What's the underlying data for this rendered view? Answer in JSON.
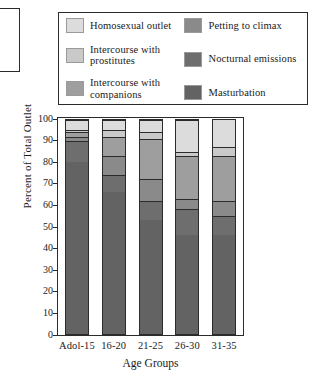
{
  "chart_data": {
    "type": "bar",
    "subtype": "stacked-percentage",
    "title": "",
    "xlabel": "Age Groups",
    "ylabel": "Percent of Total Outlet",
    "ylim": [
      0,
      100
    ],
    "yticks": [
      0,
      10,
      20,
      30,
      40,
      50,
      60,
      70,
      80,
      90,
      100
    ],
    "grid": false,
    "legend_position": "above-plot",
    "categories": [
      "Adol-15",
      "16-20",
      "21-25",
      "26-30",
      "31-35"
    ],
    "series": [
      {
        "name": "Masturbation",
        "color": "#636363",
        "values": [
          80,
          66,
          53,
          46,
          46
        ]
      },
      {
        "name": "Nocturnal emissions",
        "color": "#6e6e6e",
        "values": [
          10,
          8,
          9,
          12,
          9
        ]
      },
      {
        "name": "Petting to climax",
        "color": "#8a8a8a",
        "values": [
          2,
          9,
          10,
          5,
          7
        ]
      },
      {
        "name": "Intercourse with companions",
        "color": "#9e9e9e",
        "values": [
          2,
          9,
          19,
          20,
          21
        ]
      },
      {
        "name": "Intercourse with prostitutes",
        "color": "#c9c9c9",
        "values": [
          1,
          3,
          3,
          2,
          4
        ]
      },
      {
        "name": "Homosexual outlet",
        "color": "#dcdcdc",
        "values": [
          5,
          5,
          6,
          15,
          13
        ]
      }
    ]
  },
  "legend": {
    "items": [
      {
        "label": "Homosexual outlet",
        "color": "#dcdcdc",
        "column": 1
      },
      {
        "label": "Intercourse with prostitutes",
        "color": "#c9c9c9",
        "column": 1
      },
      {
        "label": "Intercourse with companions",
        "color": "#9e9e9e",
        "column": 1
      },
      {
        "label": "Petting to climax",
        "color": "#8a8a8a",
        "column": 2
      },
      {
        "label": "Nocturnal emissions",
        "color": "#6e6e6e",
        "column": 2
      },
      {
        "label": "Masturbation",
        "color": "#636363",
        "column": 2
      }
    ]
  }
}
